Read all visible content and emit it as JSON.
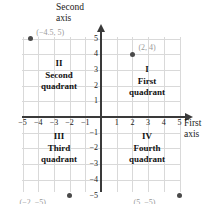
{
  "chart_data": {
    "type": "scatter",
    "title": "",
    "xlabel": "First axis",
    "ylabel": "Second axis",
    "xlim": [
      -5.5,
      5.5
    ],
    "ylim": [
      -5.5,
      5.5
    ],
    "grid": true,
    "legend": "none",
    "xticks": [
      "-5",
      "-4",
      "-3",
      "-2",
      "-1",
      "1",
      "2",
      "3",
      "4",
      "5"
    ],
    "yticks": [
      "5",
      "4",
      "3",
      "2",
      "1",
      "-1",
      "-2",
      "-3",
      "-4",
      "-5"
    ],
    "points": [
      {
        "x": -4.5,
        "y": 5,
        "label": "(−4.5, 5)"
      },
      {
        "x": 2,
        "y": 4,
        "label": "(2, 4)"
      },
      {
        "x": -2,
        "y": -5,
        "label": "(−2, −5)"
      },
      {
        "x": 5,
        "y": -5,
        "label": "(5, −5)"
      }
    ],
    "annotations": [
      {
        "name": "quadrant-I",
        "numeral": "I",
        "text": "First\nquadrant",
        "x": 3,
        "y": 2.5
      },
      {
        "name": "quadrant-II",
        "numeral": "II",
        "text": "Second\nquadrant",
        "x": -3,
        "y": 3
      },
      {
        "name": "quadrant-III",
        "numeral": "III",
        "text": "Third\nquadrant",
        "x": -3,
        "y": -2.5
      },
      {
        "name": "quadrant-IV",
        "numeral": "IV",
        "text": "Fourth\nquadrant",
        "x": 3,
        "y": -2.5
      }
    ],
    "colors": {
      "grid": "#d9d9d9",
      "axis": "#3a3a3a",
      "point": "#4a4a4a",
      "point_label": "#9a9a9a",
      "text": "#111111",
      "background": "#ffffff"
    }
  },
  "axes": {
    "vertical_title": "Second\naxis",
    "horizontal_title": "First\naxis"
  },
  "ticks": {
    "x_negative": [
      "−5",
      "−4",
      "−3",
      "−2",
      "−1"
    ],
    "x_positive": [
      "1",
      "2",
      "3",
      "4",
      "5"
    ],
    "y_positive": [
      "5",
      "4",
      "3",
      "2",
      "1"
    ],
    "y_negative": [
      "−1",
      "−2",
      "−3",
      "−4",
      "−5"
    ]
  },
  "quadrants": {
    "one": "I\nFirst\nquadrant",
    "two": "II\nSecond\nquadrant",
    "three": "III\nThird\nquadrant",
    "four": "IV\nFourth\nquadrant"
  },
  "point_labels": {
    "p1": "(−4.5, 5)",
    "p2": "(2, 4)",
    "p3": "(−2, −5)",
    "p4": "(5, −5)"
  }
}
